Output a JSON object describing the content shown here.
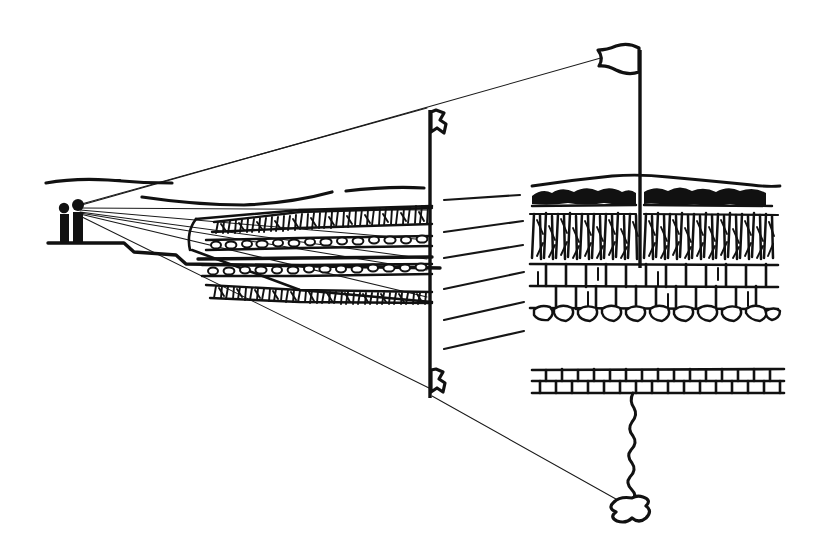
{
  "figure": {
    "medium": "hand-drawn pen and ink line illustration",
    "background_color": "#ffffff",
    "ink_color": "#111111",
    "canvas": {
      "width": 813,
      "height": 547
    }
  },
  "scene": {
    "observers": {
      "label": "two standing human figures",
      "count": 2,
      "position": {
        "x": 70,
        "y": 210
      },
      "eye_point": {
        "x": 76,
        "y": 206
      },
      "platform_label": "stepped ground platform"
    },
    "distant_horizon": {
      "label": "distant horizon line",
      "points": "44,182 72,179 108,181 146,184 170,183"
    },
    "mid_ridge": {
      "label": "middle ground ridge line",
      "left_points": "140,196 190,202 238,204 286,200 330,192",
      "right_points": "342,190 392,186 424,187"
    }
  },
  "sightlines": {
    "label": "perspective sight lines converging at observer eye",
    "count": 9,
    "origin": {
      "x": 76,
      "y": 206
    },
    "targets": [
      {
        "name": "to-upper-flag",
        "x": 636,
        "y": 47
      },
      {
        "name": "to-pole-top",
        "x": 428,
        "y": 107
      },
      {
        "name": "to-layer-1",
        "x": 432,
        "y": 208
      },
      {
        "name": "to-layer-2",
        "x": 432,
        "y": 238
      },
      {
        "name": "to-layer-3",
        "x": 432,
        "y": 258
      },
      {
        "name": "to-layer-4",
        "x": 432,
        "y": 268
      },
      {
        "name": "to-layer-5",
        "x": 432,
        "y": 296
      },
      {
        "name": "to-pole-base",
        "x": 430,
        "y": 386
      },
      {
        "name": "to-lower-blob",
        "x": 634,
        "y": 508
      }
    ]
  },
  "middle_column": {
    "label": "survey pole with stratified soil column",
    "pole": {
      "x": 430,
      "top_y": 108,
      "bottom_y": 398
    },
    "flag_top": {
      "label": "small pennant flag at pole top",
      "x": 430,
      "y": 110
    },
    "flag_bottom": {
      "label": "small pennant flag at pole base",
      "x": 430,
      "y": 372
    },
    "layers": [
      {
        "name": "root-mat-upper",
        "pattern": "dense vertical root hatching",
        "y": 212
      },
      {
        "name": "gravel-band-upper",
        "pattern": "chain of rounded pebbles",
        "y": 241
      },
      {
        "name": "solid-seam",
        "pattern": "solid dark line",
        "y": 259
      },
      {
        "name": "gravel-band-lower",
        "pattern": "chain of rounded pebbles",
        "y": 268
      },
      {
        "name": "root-mat-lower",
        "pattern": "dense vertical root hatching",
        "y": 294
      }
    ]
  },
  "leaders": {
    "label": "leader lines linking column layers to magnified detail",
    "count": 6,
    "lines": [
      {
        "from_x": 443,
        "from_y": 200,
        "to_x": 520,
        "to_y": 196
      },
      {
        "from_x": 443,
        "from_y": 232,
        "to_x": 523,
        "to_y": 222
      },
      {
        "from_x": 443,
        "from_y": 258,
        "to_x": 523,
        "to_y": 246
      },
      {
        "from_x": 443,
        "from_y": 288,
        "to_x": 524,
        "to_y": 272
      },
      {
        "from_x": 443,
        "from_y": 320,
        "to_x": 524,
        "to_y": 302
      },
      {
        "from_x": 443,
        "from_y": 348,
        "to_x": 524,
        "to_y": 330
      }
    ]
  },
  "detail_panel": {
    "label": "magnified soil profile detail, right hand side",
    "bounds": {
      "x": 530,
      "y": 40,
      "width": 260,
      "height": 290
    },
    "flag": {
      "label": "large pennant flag on mast",
      "mast_x": 638,
      "top_y": 45,
      "bottom_y": 268
    },
    "strata": [
      {
        "name": "ground-surface",
        "label": "undulating ground surface line",
        "y": 180
      },
      {
        "name": "topsoil",
        "label": "dark clumpy topsoil / organic horizon",
        "y": 192,
        "thickness": 22
      },
      {
        "name": "root-zone",
        "label": "dense root / fibrous horizon",
        "y": 216,
        "thickness": 48
      },
      {
        "name": "masonry-rock",
        "label": "blocky jointed bedrock, brick-like pattern",
        "y": 266,
        "thickness": 50
      },
      {
        "name": "cobble-base",
        "label": "rounded cobble base course",
        "y": 310,
        "thickness": 18
      }
    ]
  },
  "lower_detail": {
    "label": "detached lower stratum block with root trace",
    "block": {
      "label": "jointed rock slab",
      "x": 528,
      "y": 368,
      "width": 250,
      "height": 26
    },
    "root_trace": {
      "label": "wavy root trace descending from slab",
      "from_x": 632,
      "from_y": 394,
      "to_x": 634,
      "to_y": 492
    },
    "terminal_blob": {
      "label": "irregular terminal blob",
      "x": 634,
      "y": 506
    }
  }
}
